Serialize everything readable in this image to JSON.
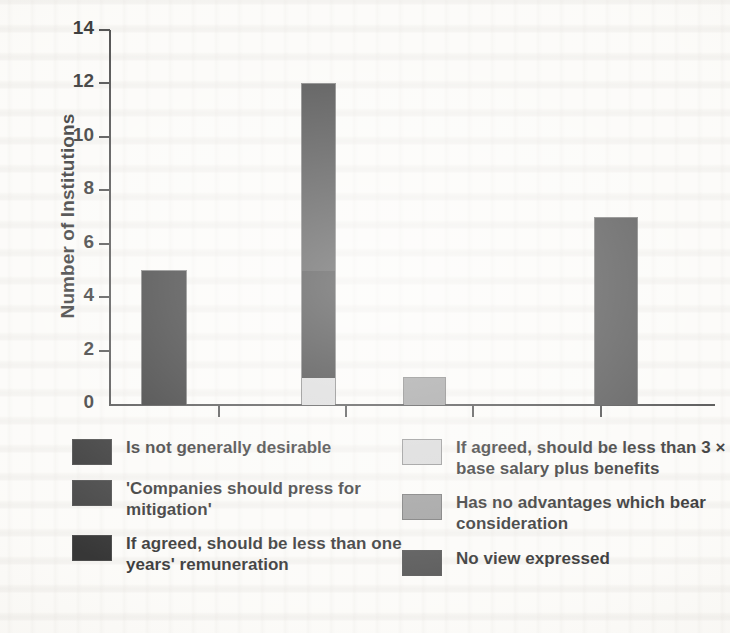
{
  "chart_data": {
    "type": "bar",
    "title": "",
    "xlabel": "",
    "ylabel": "Number of Institutions",
    "ylim": [
      0,
      14
    ],
    "y_ticks": [
      0,
      2,
      4,
      6,
      8,
      10,
      12,
      14
    ],
    "grid": false,
    "legend_position": "bottom",
    "stacked": true,
    "categories": [
      "1",
      "2",
      "3",
      "4"
    ],
    "series": [
      {
        "name": "Is not generally desirable",
        "color": "#0d0d0d",
        "values": [
          5,
          0,
          0,
          0
        ]
      },
      {
        "name": "'Companies should press for mitigation'",
        "color": "#1c1c1c",
        "values": [
          0,
          0,
          0,
          0
        ]
      },
      {
        "name": "If agreed, should be less than one years' remuneration",
        "color": "#0d0d0d",
        "values": [
          0,
          4,
          0,
          0
        ]
      },
      {
        "name": "If agreed, should be less than 3 × base salary plus benefits",
        "color": "#d2d2d2",
        "values": [
          0,
          1,
          0,
          0
        ]
      },
      {
        "name": "Has no advantages which bear consideration",
        "color": "#8d8d8d",
        "values": [
          0,
          0,
          1,
          0
        ]
      },
      {
        "name": "No view expressed",
        "color": "#2f2f2f",
        "values": [
          0,
          7,
          0,
          7
        ]
      }
    ],
    "bars": [
      {
        "index": 1,
        "x_left": 141,
        "width": 46,
        "total": 5,
        "segments": [
          {
            "label": "Is not generally desirable",
            "value": 5,
            "color": "#0d0d0d"
          }
        ]
      },
      {
        "index": 2,
        "x_left": 301,
        "width": 35,
        "total": 12,
        "segments": [
          {
            "label": "If agreed, should be less than 3 × base salary plus benefits",
            "value": 1,
            "color": "#d2d2d2"
          },
          {
            "label": "If agreed, should be less than one years' remuneration",
            "value": 4,
            "color": "#0b0b0b"
          },
          {
            "label": "No view expressed",
            "value": 7,
            "color": "#222222"
          }
        ]
      },
      {
        "index": 3,
        "x_left": 403,
        "width": 43,
        "total": 1,
        "segments": [
          {
            "label": "Has no advantages which bear consideration",
            "value": 1,
            "color": "#8d8d8d"
          }
        ]
      },
      {
        "index": 4,
        "x_left": 594,
        "width": 44,
        "total": 7,
        "segments": [
          {
            "label": "No view expressed",
            "value": 7,
            "color": "#343434"
          }
        ]
      }
    ]
  },
  "axis": {
    "y_title": "Number of Institutions",
    "y_tick_labels": [
      "14",
      "12",
      "10",
      "8",
      "6",
      "4",
      "2",
      "0"
    ],
    "x_tick_positions": [
      218,
      345,
      472,
      600
    ]
  },
  "legend": {
    "left_column": [
      {
        "label": "Is not generally desirable",
        "color": "#0d0d0d"
      },
      {
        "label": "'Companies should press for mitigation'",
        "color": "#1c1c1c"
      },
      {
        "label": "If agreed, should be less than one years' remuneration",
        "color": "#0b0b0b"
      }
    ],
    "right_column": [
      {
        "label": "If agreed, should be less than 3 × base salary plus benefits",
        "color": "#d2d2d2"
      },
      {
        "label": "Has no advantages which bear consideration",
        "color": "#8d8d8d"
      },
      {
        "label": "No view expressed",
        "color": "#343434"
      }
    ]
  },
  "colors": {
    "axis": "#2b2b2b",
    "text": "#111111",
    "page_background": "#fbfaf7"
  }
}
